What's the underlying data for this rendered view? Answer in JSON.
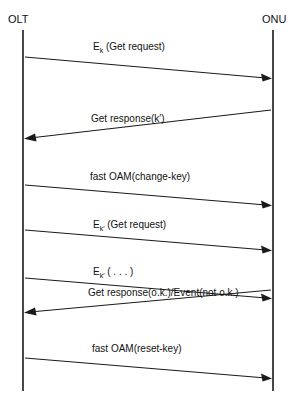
{
  "diagram": {
    "type": "sequence-diagram",
    "title": "",
    "background_color": "#ffffff",
    "line_color": "#1a1a1a",
    "lifelines": [
      {
        "id": "olt",
        "label": "OLT",
        "x": 23,
        "top": 30,
        "bottom": 391
      },
      {
        "id": "onu",
        "label": "ONU",
        "x": 273,
        "top": 30,
        "bottom": 391
      }
    ],
    "messages": [
      {
        "index": 1,
        "label": "E",
        "subscript": "k",
        "label_tail": " (Get request)",
        "full_text": "E_k (Get request)",
        "direction": "left-to-right",
        "from": "olt",
        "to": "onu",
        "y_start": 57,
        "y_end": 78,
        "label_x": 93,
        "label_y": 50
      },
      {
        "index": 2,
        "label": "Get response(k′)",
        "subscript": "",
        "label_tail": "",
        "full_text": "Get response(k')",
        "direction": "right-to-left",
        "from": "onu",
        "to": "olt",
        "y_start": 110,
        "y_end": 138,
        "label_x": 91,
        "label_y": 122
      },
      {
        "index": 3,
        "label": "fast OAM(change-key)",
        "subscript": "",
        "label_tail": "",
        "full_text": "fast OAM(change-key)",
        "direction": "left-to-right",
        "from": "olt",
        "to": "onu",
        "y_start": 185,
        "y_end": 205,
        "label_x": 90,
        "label_y": 180
      },
      {
        "index": 4,
        "label": "E",
        "subscript": "k′",
        "label_tail": " (Get request)",
        "full_text": "E_k' (Get request)",
        "direction": "left-to-right",
        "from": "olt",
        "to": "onu",
        "y_start": 230,
        "y_end": 250,
        "label_x": 93,
        "label_y": 228
      },
      {
        "index": 5,
        "label": "E",
        "subscript": "k′",
        "label_tail": " ( . . . )",
        "full_text": "E_k' ( . . . )",
        "direction": "left-to-right",
        "from": "olt",
        "to": "onu",
        "y_start": 278,
        "y_end": 298,
        "label_x": 93,
        "label_y": 275
      },
      {
        "index": 6,
        "label": "Get response(o.k.)/Event(not o.k.)",
        "subscript": "",
        "label_tail": "",
        "full_text": "Get response(o.k.)/Event(not o.k.)",
        "direction": "right-to-left",
        "from": "onu",
        "to": "olt",
        "y_start": 290,
        "y_end": 312,
        "label_x": 88,
        "label_y": 296
      },
      {
        "index": 7,
        "label": "fast OAM(reset-key)",
        "subscript": "",
        "label_tail": "",
        "full_text": "fast OAM(reset-key)",
        "direction": "left-to-right",
        "from": "olt",
        "to": "onu",
        "y_start": 358,
        "y_end": 378,
        "label_x": 92,
        "label_y": 352
      }
    ]
  }
}
